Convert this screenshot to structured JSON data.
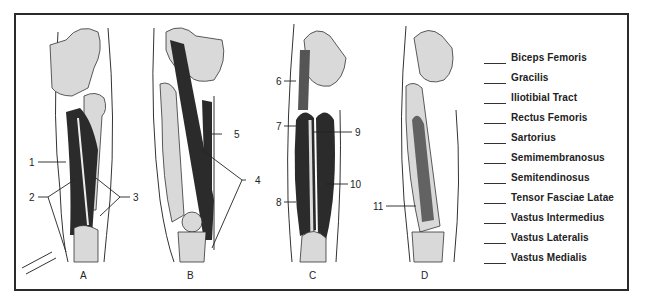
{
  "figure": {
    "panels": [
      {
        "letter": "A",
        "callouts": [
          "1",
          "2",
          "3"
        ]
      },
      {
        "letter": "B",
        "callouts": [
          "4",
          "5"
        ]
      },
      {
        "letter": "C",
        "callouts": [
          "6",
          "7",
          "8",
          "9",
          "10"
        ]
      },
      {
        "letter": "D",
        "callouts": [
          "11"
        ]
      }
    ],
    "callout_numbers": [
      "1",
      "2",
      "3",
      "4",
      "5",
      "6",
      "7",
      "8",
      "9",
      "10",
      "11"
    ]
  },
  "legend": {
    "terms": [
      "Biceps Femoris",
      "Gracilis",
      "Iliotibial Tract",
      "Rectus Femoris",
      "Sartorius",
      "Semimembranosus",
      "Semitendinosus",
      "Tensor Fasciae Latae",
      "Vastus Intermedius",
      "Vastus Lateralis",
      "Vastus Medialis"
    ]
  },
  "colors": {
    "bone": "#d9d9d9",
    "muscle": "#2b2b2b",
    "outline": "#333333",
    "frame": "#2a2a2a"
  }
}
